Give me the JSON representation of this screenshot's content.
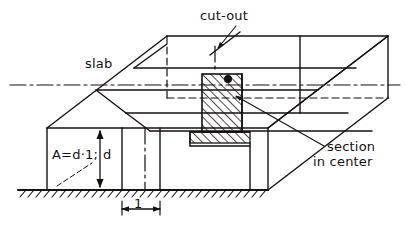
{
  "figure": {
    "type": "engineering-isometric-drawing",
    "background_color": "#ffffff",
    "ink_color": "#15110f"
  },
  "labels": {
    "slab": "slab",
    "cut_out": "cut-out",
    "section_line1": "section",
    "section_line2": "in center",
    "area_formula": "A=d·1;",
    "depth_symbol": "d",
    "unit_width": "1"
  },
  "annotations": {
    "slab_leader": "leader-line-from-slab-label-to-top-face",
    "cut_out_leader": "leader-line-from-cut-out-label-to-groove-edge",
    "section_leader": "leader-line-from-section-in-center-label-to-hatched-face",
    "depth_dimension": "vertical-double-arrow-marking-slab-thickness-d",
    "width_dimension": "horizontal-double-arrow-marking-unit-width-1"
  },
  "geometry": {
    "ground_line": {
      "x1": 18,
      "x2": 268,
      "y": 190
    },
    "front_face": {
      "left": 47,
      "right": 268,
      "top": 128,
      "bottom": 190
    },
    "depth_offset": {
      "dx": 120,
      "dy": -92
    },
    "hatched_section": {
      "x": 202,
      "y": 74,
      "width": 40,
      "height": 58
    },
    "unit_strip": {
      "x1": 122,
      "x2": 160
    }
  },
  "line_styles": {
    "solid": "visible edges",
    "dashed": "hidden edges",
    "dash_dot": "centre lines / axes",
    "hatch_45": "cut section hatching",
    "ground_hatch": "ground / support hatching"
  }
}
